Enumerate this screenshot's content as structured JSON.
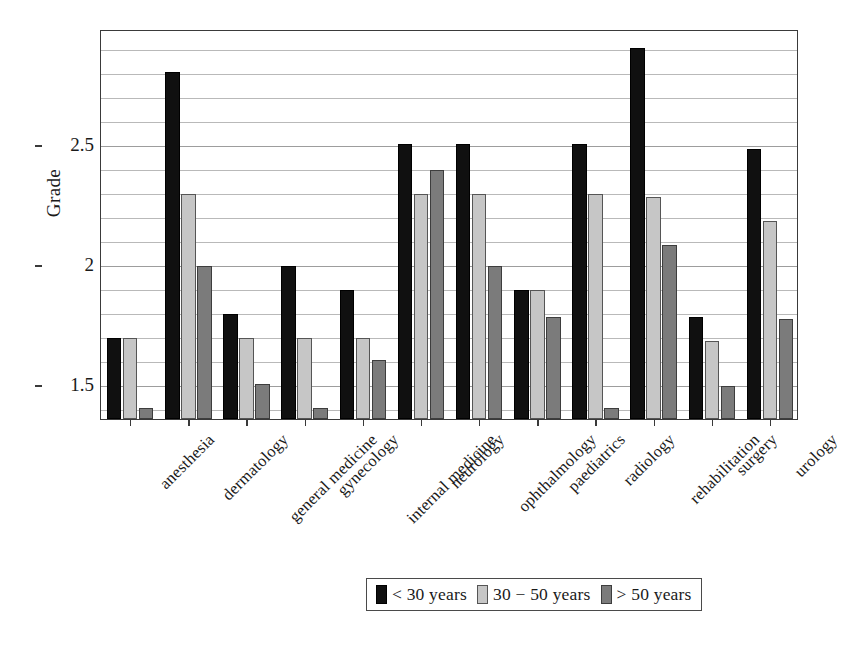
{
  "chart_data": {
    "type": "bar",
    "title": "",
    "subtitle": "",
    "xlabel": "",
    "ylabel": "Grade",
    "ylim": [
      1.354,
      2.979
    ],
    "yticks": [
      1.5,
      2,
      2.5
    ],
    "ytick_labels": [
      "1.5",
      "2",
      "2.5"
    ],
    "minor_gridlines": [
      1.4,
      1.6,
      1.7,
      1.8,
      1.9,
      2.1,
      2.2,
      2.3,
      2.4,
      2.6,
      2.7,
      2.8,
      2.9
    ],
    "grid": true,
    "legend_position": "below-center",
    "orientation": "vertical",
    "categories": [
      "anesthesia",
      "dermatology",
      "general medicine",
      "gynecology",
      "internal medicine",
      "neurology",
      "ophthalmology",
      "paediatrics",
      "radiology",
      "rehabilitation",
      "surgery",
      "urology"
    ],
    "series": [
      {
        "name": "< 30 years",
        "color": "#101010",
        "values": [
          1.69,
          2.8,
          1.79,
          1.99,
          1.89,
          2.5,
          2.5,
          1.89,
          2.5,
          2.9,
          1.78,
          2.48
        ]
      },
      {
        "name": "30 − 50 years",
        "color": "#c6c6c6",
        "values": [
          1.69,
          2.29,
          1.69,
          1.69,
          1.69,
          2.29,
          2.29,
          1.89,
          2.29,
          2.28,
          1.68,
          2.18
        ]
      },
      {
        "name": "> 50 years",
        "color": "#7b7b7b",
        "values": [
          1.4,
          1.99,
          1.5,
          1.4,
          1.6,
          2.39,
          1.99,
          1.78,
          1.4,
          2.08,
          1.49,
          1.77
        ]
      }
    ]
  },
  "legend": {
    "entries": [
      {
        "label": "< 30 years",
        "swatch": "s0"
      },
      {
        "label": "30 − 50 years",
        "swatch": "s1"
      },
      {
        "label": "> 50 years",
        "swatch": "s2"
      }
    ]
  },
  "axis": {
    "y_title": "Grade"
  }
}
